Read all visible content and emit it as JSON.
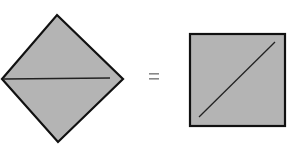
{
  "diagram": {
    "fill_color": "#b4b4b4",
    "stroke_color": "#111111",
    "equals_color": "#888888",
    "left_shape": {
      "type": "diamond",
      "points": [
        [
          57,
          15
        ],
        [
          123,
          79
        ],
        [
          58,
          142
        ],
        [
          2,
          79
        ]
      ],
      "inner_line": [
        [
          4,
          79
        ],
        [
          110,
          78
        ]
      ]
    },
    "operator": "=",
    "right_shape": {
      "type": "square",
      "x": 190,
      "y": 34,
      "width": 95,
      "height": 92,
      "inner_line": [
        [
          199,
          117
        ],
        [
          275,
          42
        ]
      ]
    }
  }
}
